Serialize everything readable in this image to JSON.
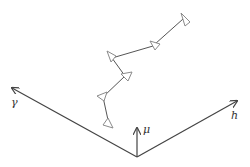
{
  "diagram": {
    "axes": [
      {
        "name": "gamma",
        "label": "γ"
      },
      {
        "name": "h",
        "label": "h"
      },
      {
        "name": "mu",
        "label": "μ"
      }
    ],
    "chain_node_count": 6,
    "colors": {
      "axis": "#444444",
      "link": "#555555",
      "node_stroke": "#8a8a8a",
      "node_fill": "#ffffff"
    }
  }
}
